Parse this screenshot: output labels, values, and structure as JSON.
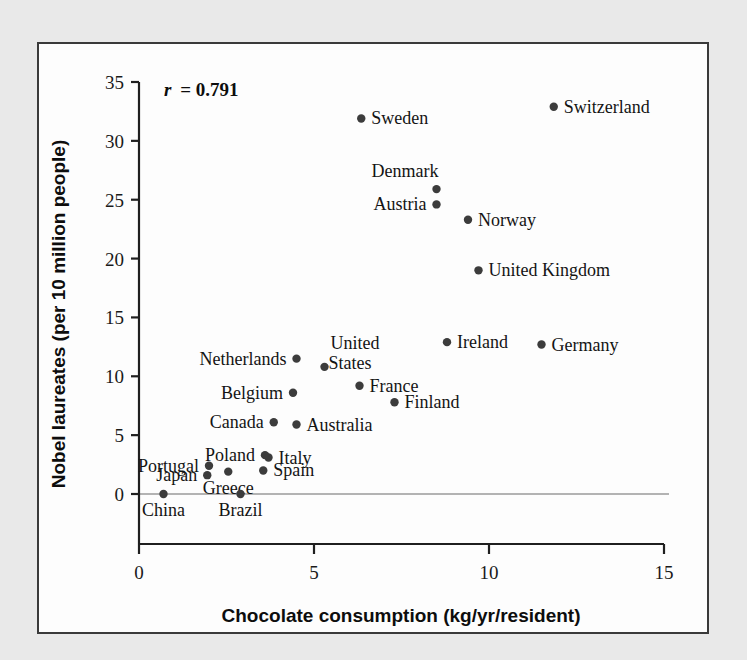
{
  "figure": {
    "background_color": "#e9e9e9",
    "panel_color": "#fdfdfd",
    "border_color": "#3a3a3a",
    "point_color": "#3c3c3c",
    "annotation": "r = 0.791",
    "annotation_symbol": "r",
    "annotation_value": "= 0.791"
  },
  "chart_data": {
    "type": "scatter",
    "title": "",
    "xlabel": "Chocolate consumption (kg/yr/resident)",
    "ylabel": "Nobel laureates (per 10 million people)",
    "xlim": [
      0,
      15
    ],
    "ylim": [
      0,
      35
    ],
    "xticks": [
      0,
      5,
      10,
      15
    ],
    "yticks": [
      0,
      5,
      10,
      15,
      20,
      25,
      30,
      35
    ],
    "xtick_labels": [
      "0",
      "5",
      "10",
      "15"
    ],
    "ytick_labels": [
      "0",
      "5",
      "10",
      "15",
      "20",
      "25",
      "30",
      "35"
    ],
    "grid": false,
    "legend": "none",
    "annotations": [
      {
        "text": "r = 0.791",
        "x": 0.45,
        "y": 34.0
      }
    ],
    "points": [
      {
        "label": "Switzerland",
        "x": 11.85,
        "y": 32.9,
        "label_pos": "right"
      },
      {
        "label": "Sweden",
        "x": 6.35,
        "y": 31.9,
        "label_pos": "right"
      },
      {
        "label": "Denmark",
        "x": 8.5,
        "y": 25.9,
        "label_pos": "above-left"
      },
      {
        "label": "Austria",
        "x": 8.5,
        "y": 24.6,
        "label_pos": "left"
      },
      {
        "label": "Norway",
        "x": 9.4,
        "y": 23.3,
        "label_pos": "right"
      },
      {
        "label": "United Kingdom",
        "x": 9.7,
        "y": 19.0,
        "label_pos": "right"
      },
      {
        "label": "Ireland",
        "x": 8.8,
        "y": 12.9,
        "label_pos": "right"
      },
      {
        "label": "Germany",
        "x": 11.5,
        "y": 12.7,
        "label_pos": "right"
      },
      {
        "label": "Netherlands",
        "x": 4.5,
        "y": 11.5,
        "label_pos": "left"
      },
      {
        "label": "United States",
        "x": 5.3,
        "y": 10.8,
        "label_pos": "above-right"
      },
      {
        "label": "France",
        "x": 6.3,
        "y": 9.2,
        "label_pos": "right"
      },
      {
        "label": "Belgium",
        "x": 4.4,
        "y": 8.6,
        "label_pos": "left"
      },
      {
        "label": "Finland",
        "x": 7.3,
        "y": 7.8,
        "label_pos": "right"
      },
      {
        "label": "Canada",
        "x": 3.85,
        "y": 6.1,
        "label_pos": "left"
      },
      {
        "label": "Australia",
        "x": 4.5,
        "y": 5.9,
        "label_pos": "right"
      },
      {
        "label": "Italy",
        "x": 3.7,
        "y": 3.1,
        "label_pos": "right"
      },
      {
        "label": "Poland",
        "x": 3.6,
        "y": 3.3,
        "label_pos": "left"
      },
      {
        "label": "Portugal",
        "x": 2.0,
        "y": 2.4,
        "label_pos": "left"
      },
      {
        "label": "Spain",
        "x": 3.55,
        "y": 2.0,
        "label_pos": "right"
      },
      {
        "label": "Greece",
        "x": 2.55,
        "y": 1.9,
        "label_pos": "below"
      },
      {
        "label": "Japan",
        "x": 1.95,
        "y": 1.6,
        "label_pos": "left"
      },
      {
        "label": "China",
        "x": 0.7,
        "y": 0.0,
        "label_pos": "below"
      },
      {
        "label": "Brazil",
        "x": 2.9,
        "y": 0.0,
        "label_pos": "below"
      }
    ]
  }
}
